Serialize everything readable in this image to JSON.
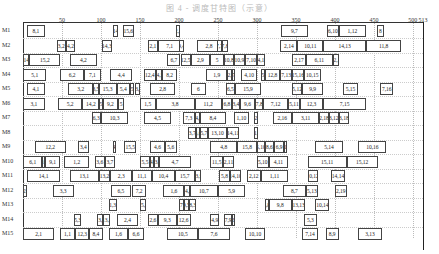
{
  "title": "图 4 - 调度甘特图（示意）",
  "chart_data": {
    "type": "gantt",
    "title": "",
    "xlabel": "",
    "ylabel": "",
    "x_ticks": [
      50,
      100,
      150,
      200,
      250,
      300,
      350,
      400,
      450,
      500,
      513
    ],
    "xlim": [
      0,
      513
    ],
    "grid": true,
    "machines": [
      "M1",
      "M2",
      "M3",
      "M4",
      "M5",
      "M6",
      "M7",
      "M8",
      "M9",
      "M10",
      "M11",
      "M12",
      "M13",
      "M14",
      "M15"
    ],
    "tasks": [
      {
        "m": "M1",
        "s": 5,
        "e": 28,
        "label": "8,1"
      },
      {
        "m": "M1",
        "s": 115,
        "e": 122,
        "label": "14"
      },
      {
        "m": "M1",
        "s": 128,
        "e": 142,
        "label": "15,6"
      },
      {
        "m": "M1",
        "s": 196,
        "e": 202,
        "label": "2,1"
      },
      {
        "m": "M1",
        "s": 331,
        "e": 365,
        "label": "9,7"
      },
      {
        "m": "M1",
        "s": 390,
        "e": 405,
        "label": "6,10"
      },
      {
        "m": "M1",
        "s": 405,
        "e": 440,
        "label": "1,12"
      },
      {
        "m": "M1",
        "s": 454,
        "e": 463,
        "label": "8"
      },
      {
        "m": "M2",
        "s": 43,
        "e": 55,
        "label": "3,2"
      },
      {
        "m": "M2",
        "s": 55,
        "e": 67,
        "label": "4,2"
      },
      {
        "m": "M2",
        "s": 101,
        "e": 114,
        "label": "14,3"
      },
      {
        "m": "M2",
        "s": 160,
        "e": 173,
        "label": "2,1"
      },
      {
        "m": "M2",
        "s": 173,
        "e": 203,
        "label": "7,1"
      },
      {
        "m": "M2",
        "s": 200,
        "e": 207,
        "label": "9,4"
      },
      {
        "m": "M2",
        "s": 223,
        "e": 254,
        "label": "2,8"
      },
      {
        "m": "M2",
        "s": 249,
        "e": 255,
        "label": "7,7"
      },
      {
        "m": "M2",
        "s": 255,
        "e": 263,
        "label": "7,8"
      },
      {
        "m": "M2",
        "s": 330,
        "e": 352,
        "label": "2,14"
      },
      {
        "m": "M2",
        "s": 352,
        "e": 385,
        "label": "10,11"
      },
      {
        "m": "M2",
        "s": 385,
        "e": 440,
        "label": "14,13"
      },
      {
        "m": "M2",
        "s": 440,
        "e": 485,
        "label": "11,8"
      },
      {
        "m": "M3",
        "s": 0,
        "e": 8,
        "label": "14"
      },
      {
        "m": "M3",
        "s": 8,
        "e": 48,
        "label": "15,2"
      },
      {
        "m": "M3",
        "s": 60,
        "e": 95,
        "label": "4,2"
      },
      {
        "m": "M3",
        "s": 185,
        "e": 202,
        "label": "6,7"
      },
      {
        "m": "M3",
        "s": 202,
        "e": 215,
        "label": "12,5"
      },
      {
        "m": "M3",
        "s": 215,
        "e": 240,
        "label": "2,9"
      },
      {
        "m": "M3",
        "s": 240,
        "e": 258,
        "label": "5"
      },
      {
        "m": "M3",
        "s": 258,
        "e": 270,
        "label": "10,8"
      },
      {
        "m": "M3",
        "s": 270,
        "e": 285,
        "label": "10,9"
      },
      {
        "m": "M3",
        "s": 285,
        "e": 300,
        "label": "7,10"
      },
      {
        "m": "M3",
        "s": 300,
        "e": 310,
        "label": "14,12"
      },
      {
        "m": "M3",
        "s": 345,
        "e": 363,
        "label": "2,17"
      },
      {
        "m": "M3",
        "s": 363,
        "e": 397,
        "label": "6,11"
      },
      {
        "m": "M3",
        "s": 397,
        "e": 405,
        "label": "12,1"
      },
      {
        "m": "M4",
        "s": 0,
        "e": 30,
        "label": "5,1"
      },
      {
        "m": "M4",
        "s": 48,
        "e": 78,
        "label": "6,2"
      },
      {
        "m": "M4",
        "s": 78,
        "e": 100,
        "label": "7,1"
      },
      {
        "m": "M4",
        "s": 112,
        "e": 140,
        "label": "4,4"
      },
      {
        "m": "M4",
        "s": 155,
        "e": 170,
        "label": "12,4"
      },
      {
        "m": "M4",
        "s": 170,
        "e": 178,
        "label": "14,5"
      },
      {
        "m": "M4",
        "s": 178,
        "e": 198,
        "label": "8,2"
      },
      {
        "m": "M4",
        "s": 235,
        "e": 262,
        "label": "1,9"
      },
      {
        "m": "M4",
        "s": 262,
        "e": 268,
        "label": "12,5"
      },
      {
        "m": "M4",
        "s": 268,
        "e": 272,
        "label": "7"
      },
      {
        "m": "M4",
        "s": 280,
        "e": 300,
        "label": "4,10"
      },
      {
        "m": "M4",
        "s": 305,
        "e": 310,
        "label": "5"
      },
      {
        "m": "M4",
        "s": 310,
        "e": 330,
        "label": "12,8"
      },
      {
        "m": "M4",
        "s": 330,
        "e": 345,
        "label": "7,13"
      },
      {
        "m": "M4",
        "s": 345,
        "e": 360,
        "label": "15,16"
      },
      {
        "m": "M4",
        "s": 360,
        "e": 382,
        "label": "10,15"
      },
      {
        "m": "M5",
        "s": 5,
        "e": 28,
        "label": "4,1"
      },
      {
        "m": "M5",
        "s": 58,
        "e": 90,
        "label": "3,2"
      },
      {
        "m": "M5",
        "s": 90,
        "e": 97,
        "label": "3,5"
      },
      {
        "m": "M5",
        "s": 97,
        "e": 120,
        "label": "15,3"
      },
      {
        "m": "M5",
        "s": 120,
        "e": 137,
        "label": "5,4"
      },
      {
        "m": "M5",
        "s": 137,
        "e": 143,
        "label": "5"
      },
      {
        "m": "M5",
        "s": 143,
        "e": 150,
        "label": "13,7"
      },
      {
        "m": "M5",
        "s": 163,
        "e": 195,
        "label": "2,8"
      },
      {
        "m": "M5",
        "s": 215,
        "e": 235,
        "label": "6"
      },
      {
        "m": "M5",
        "s": 260,
        "e": 272,
        "label": "6,5"
      },
      {
        "m": "M5",
        "s": 272,
        "e": 305,
        "label": "15,9"
      },
      {
        "m": "M5",
        "s": 345,
        "e": 358,
        "label": "5,12"
      },
      {
        "m": "M5",
        "s": 358,
        "e": 385,
        "label": "9,9"
      },
      {
        "m": "M5",
        "s": 410,
        "e": 430,
        "label": "5,15"
      },
      {
        "m": "M5",
        "s": 458,
        "e": 475,
        "label": "7,16"
      },
      {
        "m": "M6",
        "s": 0,
        "e": 28,
        "label": "3,1"
      },
      {
        "m": "M6",
        "s": 45,
        "e": 76,
        "label": "5,2"
      },
      {
        "m": "M6",
        "s": 76,
        "e": 98,
        "label": "14,2"
      },
      {
        "m": "M6",
        "s": 98,
        "e": 102,
        "label": "5"
      },
      {
        "m": "M6",
        "s": 102,
        "e": 122,
        "label": "9,2"
      },
      {
        "m": "M6",
        "s": 122,
        "e": 130,
        "label": "5"
      },
      {
        "m": "M6",
        "s": 150,
        "e": 170,
        "label": "1,5"
      },
      {
        "m": "M6",
        "s": 170,
        "e": 220,
        "label": "3,8"
      },
      {
        "m": "M6",
        "s": 220,
        "e": 255,
        "label": "11,2"
      },
      {
        "m": "M6",
        "s": 255,
        "e": 268,
        "label": "6,8"
      },
      {
        "m": "M6",
        "s": 268,
        "e": 278,
        "label": "3,4"
      },
      {
        "m": "M6",
        "s": 278,
        "e": 298,
        "label": "9,6"
      },
      {
        "m": "M6",
        "s": 298,
        "e": 308,
        "label": "7,8"
      },
      {
        "m": "M6",
        "s": 308,
        "e": 340,
        "label": "7,12"
      },
      {
        "m": "M6",
        "s": 340,
        "e": 355,
        "label": "5,11"
      },
      {
        "m": "M6",
        "s": 355,
        "e": 385,
        "label": "12,3"
      },
      {
        "m": "M6",
        "s": 385,
        "e": 440,
        "label": "7,15"
      },
      {
        "m": "M7",
        "s": 88,
        "e": 100,
        "label": "6,3"
      },
      {
        "m": "M7",
        "s": 100,
        "e": 135,
        "label": "10,3"
      },
      {
        "m": "M7",
        "s": 155,
        "e": 190,
        "label": "4,5"
      },
      {
        "m": "M7",
        "s": 205,
        "e": 220,
        "label": "7,3"
      },
      {
        "m": "M7",
        "s": 220,
        "e": 227,
        "label": "14,8"
      },
      {
        "m": "M7",
        "s": 227,
        "e": 260,
        "label": "8,4"
      },
      {
        "m": "M7",
        "s": 270,
        "e": 290,
        "label": "1,10"
      },
      {
        "m": "M7",
        "s": 296,
        "e": 301,
        "label": "2"
      },
      {
        "m": "M7",
        "s": 320,
        "e": 345,
        "label": "2,16"
      },
      {
        "m": "M7",
        "s": 345,
        "e": 380,
        "label": "3,11"
      },
      {
        "m": "M7",
        "s": 380,
        "e": 392,
        "label": "2,18"
      },
      {
        "m": "M7",
        "s": 392,
        "e": 405,
        "label": "3,12"
      },
      {
        "m": "M7",
        "s": 405,
        "e": 418,
        "label": "3,18"
      },
      {
        "m": "M8",
        "s": 212,
        "e": 222,
        "label": "3,7"
      },
      {
        "m": "M8",
        "s": 222,
        "e": 227,
        "label": "3,6"
      },
      {
        "m": "M8",
        "s": 227,
        "e": 237,
        "label": "5,7"
      },
      {
        "m": "M8",
        "s": 237,
        "e": 262,
        "label": "13,10"
      },
      {
        "m": "M8",
        "s": 262,
        "e": 277,
        "label": "14,11"
      },
      {
        "m": "M8",
        "s": 296,
        "e": 302,
        "label": "11,7"
      },
      {
        "m": "M9",
        "s": 15,
        "e": 55,
        "label": "12,2"
      },
      {
        "m": "M9",
        "s": 70,
        "e": 85,
        "label": "3,4"
      },
      {
        "m": "M9",
        "s": 115,
        "e": 118,
        "label": "4"
      },
      {
        "m": "M9",
        "s": 130,
        "e": 145,
        "label": "15,5"
      },
      {
        "m": "M9",
        "s": 163,
        "e": 182,
        "label": "4,6"
      },
      {
        "m": "M9",
        "s": 182,
        "e": 197,
        "label": "5,6"
      },
      {
        "m": "M9",
        "s": 240,
        "e": 275,
        "label": "4,8"
      },
      {
        "m": "M9",
        "s": 275,
        "e": 300,
        "label": "15,8"
      },
      {
        "m": "M9",
        "s": 300,
        "e": 310,
        "label": "5,10"
      },
      {
        "m": "M9",
        "s": 310,
        "e": 322,
        "label": "8,6"
      },
      {
        "m": "M9",
        "s": 322,
        "e": 335,
        "label": "6,9"
      },
      {
        "m": "M9",
        "s": 335,
        "e": 338,
        "label": "1"
      },
      {
        "m": "M9",
        "s": 375,
        "e": 410,
        "label": "5,14"
      },
      {
        "m": "M9",
        "s": 430,
        "e": 466,
        "label": "10,16"
      },
      {
        "m": "M10",
        "s": 0,
        "e": 25,
        "label": "6,1"
      },
      {
        "m": "M10",
        "s": 25,
        "e": 28,
        "label": "10"
      },
      {
        "m": "M10",
        "s": 28,
        "e": 48,
        "label": "9,1"
      },
      {
        "m": "M10",
        "s": 53,
        "e": 85,
        "label": "1,2"
      },
      {
        "m": "M10",
        "s": 92,
        "e": 105,
        "label": "3,6"
      },
      {
        "m": "M10",
        "s": 105,
        "e": 118,
        "label": "3,7"
      },
      {
        "m": "M10",
        "s": 150,
        "e": 163,
        "label": "5,5"
      },
      {
        "m": "M10",
        "s": 163,
        "e": 168,
        "label": "14,6"
      },
      {
        "m": "M10",
        "s": 168,
        "e": 175,
        "label": "13,6"
      },
      {
        "m": "M10",
        "s": 175,
        "e": 215,
        "label": "4,7"
      },
      {
        "m": "M10",
        "s": 240,
        "e": 257,
        "label": "11,5"
      },
      {
        "m": "M10",
        "s": 257,
        "e": 270,
        "label": "2,11"
      },
      {
        "m": "M10",
        "s": 300,
        "e": 315,
        "label": "5,10"
      },
      {
        "m": "M10",
        "s": 315,
        "e": 340,
        "label": "4,11"
      },
      {
        "m": "M10",
        "s": 365,
        "e": 415,
        "label": "15,11"
      },
      {
        "m": "M10",
        "s": 415,
        "e": 455,
        "label": "15,12"
      },
      {
        "m": "M11",
        "s": 5,
        "e": 48,
        "label": "14,1"
      },
      {
        "m": "M11",
        "s": 60,
        "e": 97,
        "label": "13,1"
      },
      {
        "m": "M11",
        "s": 97,
        "e": 112,
        "label": "13,2"
      },
      {
        "m": "M11",
        "s": 112,
        "e": 140,
        "label": "2,3"
      },
      {
        "m": "M11",
        "s": 140,
        "e": 165,
        "label": "11,1"
      },
      {
        "m": "M11",
        "s": 165,
        "e": 195,
        "label": "10,4"
      },
      {
        "m": "M11",
        "s": 195,
        "e": 220,
        "label": "15,7"
      },
      {
        "m": "M11",
        "s": 220,
        "e": 228,
        "label": "13,9"
      },
      {
        "m": "M11",
        "s": 252,
        "e": 265,
        "label": "5,8"
      },
      {
        "m": "M11",
        "s": 265,
        "e": 280,
        "label": "14,10"
      },
      {
        "m": "M11",
        "s": 287,
        "e": 305,
        "label": "2,12"
      },
      {
        "m": "M11",
        "s": 305,
        "e": 340,
        "label": "1,11"
      },
      {
        "m": "M11",
        "s": 365,
        "e": 378,
        "label": "10,12"
      },
      {
        "m": "M11",
        "s": 395,
        "e": 413,
        "label": "14,14"
      },
      {
        "m": "M12",
        "s": 0,
        "e": 5,
        "label": "12,1"
      },
      {
        "m": "M12",
        "s": 38,
        "e": 65,
        "label": "3,3"
      },
      {
        "m": "M12",
        "s": 113,
        "e": 138,
        "label": "6,5"
      },
      {
        "m": "M12",
        "s": 140,
        "e": 158,
        "label": "7,2"
      },
      {
        "m": "M12",
        "s": 180,
        "e": 207,
        "label": "1,6"
      },
      {
        "m": "M12",
        "s": 207,
        "e": 214,
        "label": "14,8"
      },
      {
        "m": "M12",
        "s": 214,
        "e": 250,
        "label": "10,7"
      },
      {
        "m": "M12",
        "s": 250,
        "e": 285,
        "label": "5,9"
      },
      {
        "m": "M12",
        "s": 333,
        "e": 363,
        "label": "8,7"
      },
      {
        "m": "M12",
        "s": 363,
        "e": 378,
        "label": "5,13"
      },
      {
        "m": "M12",
        "s": 400,
        "e": 415,
        "label": "2,19"
      },
      {
        "m": "M13",
        "s": 110,
        "e": 120,
        "label": "1,3"
      },
      {
        "m": "M13",
        "s": 150,
        "e": 158,
        "label": "15,8"
      },
      {
        "m": "M13",
        "s": 200,
        "e": 206,
        "label": "7"
      },
      {
        "m": "M13",
        "s": 206,
        "e": 213,
        "label": "9,5"
      },
      {
        "m": "M13",
        "s": 213,
        "e": 222,
        "label": "8,3"
      },
      {
        "m": "M13",
        "s": 310,
        "e": 315,
        "label": "8,8"
      },
      {
        "m": "M13",
        "s": 315,
        "e": 345,
        "label": "9,8"
      },
      {
        "m": "M13",
        "s": 345,
        "e": 362,
        "label": "13,13"
      },
      {
        "m": "M13",
        "s": 375,
        "e": 393,
        "label": "10,14"
      },
      {
        "m": "M14",
        "s": 65,
        "e": 75,
        "label": "5,3"
      },
      {
        "m": "M14",
        "s": 95,
        "e": 103,
        "label": "13,3"
      },
      {
        "m": "M14",
        "s": 103,
        "e": 112,
        "label": "13,4"
      },
      {
        "m": "M14",
        "s": 120,
        "e": 148,
        "label": "2,4"
      },
      {
        "m": "M14",
        "s": 160,
        "e": 173,
        "label": "2,6"
      },
      {
        "m": "M14",
        "s": 173,
        "e": 197,
        "label": "9,3"
      },
      {
        "m": "M14",
        "s": 197,
        "e": 215,
        "label": "12,6"
      },
      {
        "m": "M14",
        "s": 240,
        "e": 252,
        "label": "4,9"
      },
      {
        "m": "M14",
        "s": 258,
        "e": 268,
        "label": "7,9"
      },
      {
        "m": "M14",
        "s": 268,
        "e": 272,
        "label": "12,6"
      },
      {
        "m": "M14",
        "s": 360,
        "e": 377,
        "label": "5,3"
      },
      {
        "m": "M15",
        "s": 0,
        "e": 40,
        "label": "2,1"
      },
      {
        "m": "M15",
        "s": 47,
        "e": 67,
        "label": "1,1"
      },
      {
        "m": "M15",
        "s": 67,
        "e": 85,
        "label": "12,3"
      },
      {
        "m": "M15",
        "s": 85,
        "e": 102,
        "label": "8,4"
      },
      {
        "m": "M15",
        "s": 110,
        "e": 135,
        "label": "1,6"
      },
      {
        "m": "M15",
        "s": 135,
        "e": 155,
        "label": "6,6"
      },
      {
        "m": "M15",
        "s": 185,
        "e": 225,
        "label": "10,5"
      },
      {
        "m": "M15",
        "s": 225,
        "e": 265,
        "label": "7,6"
      },
      {
        "m": "M15",
        "s": 285,
        "e": 310,
        "label": "10,10"
      },
      {
        "m": "M15",
        "s": 358,
        "e": 378,
        "label": "7,14"
      },
      {
        "m": "M15",
        "s": 388,
        "e": 405,
        "label": "8,9"
      },
      {
        "m": "M15",
        "s": 430,
        "e": 460,
        "label": "3,13"
      }
    ]
  }
}
